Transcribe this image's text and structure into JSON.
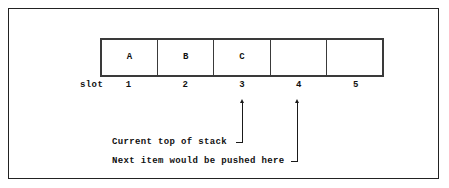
{
  "figure": {
    "type": "stack-diagram",
    "title_text": "",
    "background_color": "#ffffff",
    "line_color": "#1a1a1a",
    "frame_color": "#222222"
  },
  "stack": {
    "slot_label": "slot",
    "cells": [
      {
        "slot": "1",
        "value": "A"
      },
      {
        "slot": "2",
        "value": "B"
      },
      {
        "slot": "3",
        "value": "C"
      },
      {
        "slot": "4",
        "value": ""
      },
      {
        "slot": "5",
        "value": ""
      }
    ]
  },
  "annotations": [
    {
      "name": "current-top-of-stack",
      "text": "Current top of stack",
      "points_to_slot": "3"
    },
    {
      "name": "next-push-location",
      "text": "Next item would be pushed here",
      "points_to_slot": "4"
    }
  ]
}
